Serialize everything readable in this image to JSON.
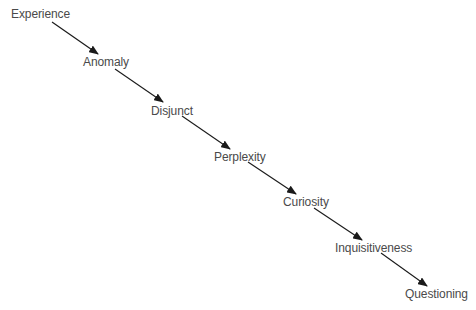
{
  "diagram": {
    "type": "flow",
    "direction": "diagonal-top-left-to-bottom-right",
    "colors": {
      "text": "#4a4a4a",
      "arrow": "#1a1a1a",
      "background": "#ffffff"
    },
    "nodes": [
      {
        "id": "experience",
        "label": "Experience"
      },
      {
        "id": "anomaly",
        "label": "Anomaly"
      },
      {
        "id": "disjunct",
        "label": "Disjunct"
      },
      {
        "id": "perplexity",
        "label": "Perplexity"
      },
      {
        "id": "curiosity",
        "label": "Curiosity"
      },
      {
        "id": "inquisitiveness",
        "label": "Inquisitiveness"
      },
      {
        "id": "questioning",
        "label": "Questioning"
      }
    ],
    "edges": [
      {
        "from": "experience",
        "to": "anomaly"
      },
      {
        "from": "anomaly",
        "to": "disjunct"
      },
      {
        "from": "disjunct",
        "to": "perplexity"
      },
      {
        "from": "perplexity",
        "to": "curiosity"
      },
      {
        "from": "curiosity",
        "to": "inquisitiveness"
      },
      {
        "from": "inquisitiveness",
        "to": "questioning"
      }
    ]
  }
}
